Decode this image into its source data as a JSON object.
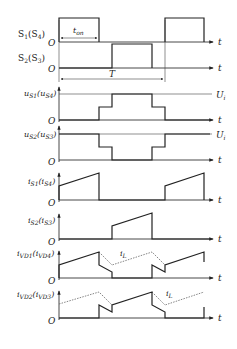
{
  "diagram": {
    "type": "switching waveforms",
    "panels": [
      {
        "id": "s1",
        "label_main": "S",
        "label_sub1": "1",
        "label_paren": "(S",
        "label_sub2": "4",
        "label_close": ")",
        "origin": "O",
        "axis": "t",
        "note": "t",
        "note_sub": "on"
      },
      {
        "id": "s2",
        "label_main": "S",
        "label_sub1": "2",
        "label_paren": "(S",
        "label_sub2": "3",
        "label_close": ")",
        "origin": "O",
        "axis": "t",
        "period": "T"
      },
      {
        "id": "us1",
        "label_main": "u",
        "label_sub1": "S1",
        "label_paren": "(u",
        "label_sub2": "S4",
        "label_close": ")",
        "origin": "O",
        "axis": "t",
        "level": "U",
        "level_sub": "i"
      },
      {
        "id": "us2",
        "label_main": "u",
        "label_sub1": "S2",
        "label_paren": "(u",
        "label_sub2": "S3",
        "label_close": ")",
        "origin": "O",
        "axis": "t",
        "level": "U",
        "level_sub": "i"
      },
      {
        "id": "is1",
        "label_main": "i",
        "label_sub1": "S1",
        "label_paren": "(i",
        "label_sub2": "S4",
        "label_close": ")",
        "origin": "O",
        "axis": "t"
      },
      {
        "id": "is2",
        "label_main": "i",
        "label_sub1": "S2",
        "label_paren": "(i",
        "label_sub2": "S3",
        "label_close": ")",
        "origin": "O",
        "axis": "t"
      },
      {
        "id": "ivd1",
        "label_main": "i",
        "label_sub1": "VD1",
        "label_paren": "(i",
        "label_sub2": "VD4",
        "label_close": ")",
        "origin": "O",
        "axis": "t",
        "ref": "i",
        "ref_sub": "L"
      },
      {
        "id": "ivd2",
        "label_main": "i",
        "label_sub1": "VD2",
        "label_paren": "(i",
        "label_sub2": "VD3",
        "label_close": ")",
        "origin": "O",
        "axis": "t",
        "ref": "i",
        "ref_sub": "L"
      }
    ]
  }
}
